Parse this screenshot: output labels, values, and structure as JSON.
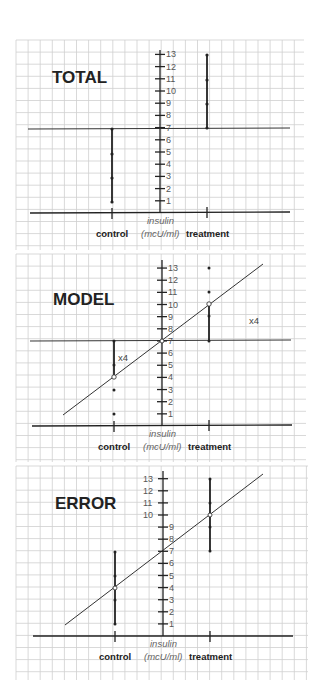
{
  "panels": [
    {
      "title": "TOTAL",
      "groups": {
        "control": "control",
        "treatment": "treatment"
      },
      "axis_label_line1": "insulin",
      "axis_label_line2": "(mcU/ml)",
      "annotations": []
    },
    {
      "title": "MODEL",
      "groups": {
        "control": "control",
        "treatment": "treatment"
      },
      "axis_label_line1": "insulin",
      "axis_label_line2": "(mcU/ml)",
      "annotations": [
        "x4",
        "x4"
      ]
    },
    {
      "title": "ERROR",
      "groups": {
        "control": "control",
        "treatment": "treatment"
      },
      "axis_label_line1": "insulin",
      "axis_label_line2": "(mcU/ml)",
      "annotations": []
    }
  ],
  "y_ticks": [
    "1",
    "2",
    "3",
    "4",
    "5",
    "6",
    "7",
    "8",
    "9",
    "10",
    "11",
    "12",
    "13"
  ],
  "chart_data": [
    {
      "type": "scatter",
      "title": "TOTAL",
      "ylabel": "insulin (mcU/ml)",
      "categories": [
        "control",
        "treatment"
      ],
      "series": [
        {
          "name": "control",
          "values": [
            1,
            3,
            5,
            7
          ]
        },
        {
          "name": "treatment",
          "values": [
            7,
            9,
            11,
            13
          ]
        }
      ],
      "grand_mean": 7,
      "ylim": [
        0,
        13
      ],
      "grid": true,
      "notes": "Vertical lines show deviation of each group's data from the grand mean (7)."
    },
    {
      "type": "scatter",
      "title": "MODEL",
      "ylabel": "insulin (mcU/ml)",
      "categories": [
        "control",
        "treatment"
      ],
      "series": [
        {
          "name": "control",
          "values": [
            1,
            3,
            5,
            7
          ]
        },
        {
          "name": "treatment",
          "values": [
            7,
            9,
            11,
            13
          ]
        }
      ],
      "grand_mean": 7,
      "group_means": {
        "control": 4,
        "treatment": 10
      },
      "annotations": [
        "x4 (control)",
        "x4 (treatment)"
      ],
      "ylim": [
        0,
        13
      ],
      "grid": true,
      "notes": "Regression line through group means (4, 10); vertical lines show model deviation from grand mean, multiplied by 4."
    },
    {
      "type": "scatter",
      "title": "ERROR",
      "ylabel": "insulin (mcU/ml)",
      "categories": [
        "control",
        "treatment"
      ],
      "series": [
        {
          "name": "control",
          "values": [
            1,
            3,
            5,
            7
          ]
        },
        {
          "name": "treatment",
          "values": [
            7,
            9,
            11,
            13
          ]
        }
      ],
      "group_means": {
        "control": 4,
        "treatment": 10
      },
      "ylim": [
        0,
        13
      ],
      "grid": true,
      "notes": "Vertical lines show residual deviation of data points from group means."
    }
  ]
}
